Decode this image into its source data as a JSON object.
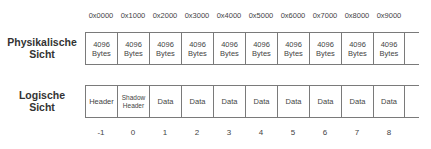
{
  "diagram": {
    "addresses": [
      "0x0000",
      "0x1000",
      "0x2000",
      "0x3000",
      "0x4000",
      "0x5000",
      "0x6000",
      "0x7000",
      "0x8000",
      "0x9000"
    ],
    "physical": {
      "label_line1": "Physikalische",
      "label_line2": "Sicht",
      "cells": [
        {
          "line1": "4096",
          "line2": "Bytes"
        },
        {
          "line1": "4096",
          "line2": "Bytes"
        },
        {
          "line1": "4096",
          "line2": "Bytes"
        },
        {
          "line1": "4096",
          "line2": "Bytes"
        },
        {
          "line1": "4096",
          "line2": "Bytes"
        },
        {
          "line1": "4096",
          "line2": "Bytes"
        },
        {
          "line1": "4096",
          "line2": "Bytes"
        },
        {
          "line1": "4096",
          "line2": "Bytes"
        },
        {
          "line1": "4096",
          "line2": "Bytes"
        },
        {
          "line1": "4096",
          "line2": "Bytes"
        }
      ]
    },
    "logical": {
      "label_line1": "Logische",
      "label_line2": "Sicht",
      "cells": [
        {
          "line1": "Header",
          "line2": ""
        },
        {
          "line1": "Shadow",
          "line2": "Header"
        },
        {
          "line1": "Data",
          "line2": ""
        },
        {
          "line1": "Data",
          "line2": ""
        },
        {
          "line1": "Data",
          "line2": ""
        },
        {
          "line1": "Data",
          "line2": ""
        },
        {
          "line1": "Data",
          "line2": ""
        },
        {
          "line1": "Data",
          "line2": ""
        },
        {
          "line1": "Data",
          "line2": ""
        },
        {
          "line1": "Data",
          "line2": ""
        }
      ]
    },
    "indices": [
      "-1",
      "0",
      "1",
      "2",
      "3",
      "4",
      "5",
      "6",
      "7",
      "8"
    ]
  }
}
